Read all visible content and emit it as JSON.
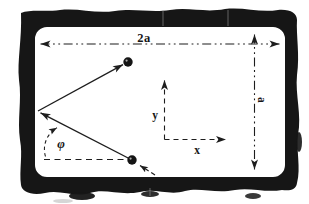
{
  "figure": {
    "labels": {
      "width_dimension": "2a",
      "height_dimension": "a",
      "x_axis": "x",
      "y_axis": "y",
      "angle": "φ"
    },
    "colors": {
      "frame": "#161616",
      "ink": "#1d1d1d",
      "paper": "#fdfdfc",
      "background": "#ffffff"
    }
  }
}
